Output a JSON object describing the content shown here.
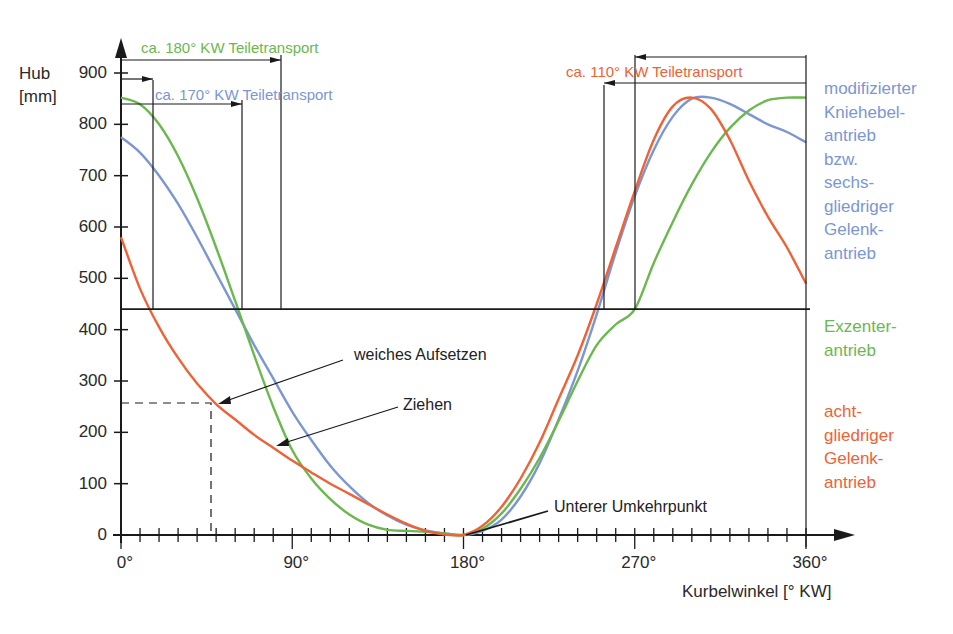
{
  "chart_data": {
    "type": "line",
    "title": "",
    "xlabel": "Kurbelwinkel [° KW]",
    "ylabel": "Hub [mm]",
    "ylabel_lines": [
      "Hub",
      "[mm]"
    ],
    "xlim": [
      0,
      360
    ],
    "ylim": [
      0,
      900
    ],
    "x_ticks": [
      0,
      90,
      180,
      270,
      360
    ],
    "x_tick_labels": [
      "0°",
      "90°",
      "180°",
      "270°",
      "360°"
    ],
    "minor_x_tick_step": 10,
    "y_ticks": [
      0,
      100,
      200,
      300,
      400,
      500,
      600,
      700,
      800,
      900
    ],
    "y_tick_labels": [
      "0",
      "100",
      "200",
      "300",
      "400",
      "500",
      "600",
      "700",
      "800",
      "900"
    ],
    "grid": false,
    "reference_line_y": 440,
    "series": [
      {
        "name": "modifizierter Kniehebelantrieb bzw. sechsgliedriger Gelenkantrieb",
        "color": "#7b96d2",
        "x": [
          0,
          10,
          20,
          30,
          40,
          50,
          60,
          70,
          80,
          90,
          100,
          110,
          120,
          130,
          140,
          150,
          160,
          170,
          180,
          190,
          200,
          210,
          220,
          230,
          240,
          250,
          260,
          270,
          280,
          290,
          300,
          310,
          320,
          330,
          340,
          350,
          360
        ],
        "y": [
          775,
          745,
          700,
          645,
          580,
          510,
          440,
          370,
          305,
          240,
          185,
          135,
          95,
          62,
          38,
          20,
          9,
          3,
          0,
          8,
          30,
          75,
          140,
          225,
          320,
          430,
          550,
          660,
          750,
          815,
          850,
          852,
          840,
          820,
          800,
          785,
          765
        ]
      },
      {
        "name": "Exzenterantrieb",
        "color": "#6ab84e",
        "x": [
          0,
          10,
          20,
          30,
          40,
          50,
          60,
          70,
          80,
          90,
          100,
          110,
          120,
          130,
          140,
          150,
          160,
          170,
          180,
          190,
          200,
          210,
          220,
          230,
          240,
          250,
          260,
          270,
          280,
          290,
          300,
          310,
          320,
          330,
          340,
          350,
          360
        ],
        "y": [
          852,
          839,
          800,
          738,
          656,
          560,
          456,
          350,
          250,
          165,
          110,
          70,
          40,
          20,
          10,
          8,
          6,
          3,
          0,
          12,
          42,
          90,
          150,
          222,
          300,
          370,
          410,
          440,
          530,
          610,
          683,
          745,
          793,
          827,
          847,
          852,
          852
        ]
      },
      {
        "name": "achtgliedriger Gelenkantrieb",
        "color": "#ee6236",
        "x": [
          0,
          10,
          20,
          30,
          40,
          50,
          60,
          70,
          80,
          90,
          100,
          110,
          120,
          130,
          140,
          150,
          160,
          170,
          180,
          190,
          200,
          210,
          220,
          230,
          240,
          250,
          260,
          270,
          280,
          290,
          300,
          310,
          320,
          330,
          340,
          350,
          360
        ],
        "y": [
          580,
          480,
          405,
          345,
          295,
          255,
          225,
          195,
          170,
          145,
          122,
          100,
          80,
          60,
          40,
          22,
          8,
          1,
          0,
          18,
          55,
          110,
          180,
          265,
          350,
          450,
          560,
          670,
          770,
          835,
          852,
          830,
          770,
          690,
          620,
          560,
          490
        ]
      }
    ],
    "annotations": [
      {
        "text": "ca. 180° KW Teiletransport",
        "color": "#6ab84e"
      },
      {
        "text": "ca. 170° KW Teiletransport",
        "color": "#7b96d2"
      },
      {
        "text": "ca. 110° KW Teiletransport",
        "color": "#ee6236"
      },
      {
        "text": "weiches Aufsetzen",
        "color": "#222222"
      },
      {
        "text": "Ziehen",
        "color": "#222222"
      },
      {
        "text": "Unterer Umkehrpunkt",
        "color": "#222222"
      }
    ],
    "legend": [
      {
        "lines": [
          "modifizierter",
          "Kniehebel-",
          "antrieb",
          "bzw.",
          "sechs-",
          "gliedriger",
          "Gelenk-",
          "antrieb"
        ],
        "color": "#7b96d2"
      },
      {
        "lines": [
          "Exzenter-",
          "antrieb"
        ],
        "color": "#6ab84e"
      },
      {
        "lines": [
          "acht-",
          "gliedriger",
          "Gelenk-",
          "antrieb"
        ],
        "color": "#ee6236"
      }
    ],
    "legend_position": "right"
  }
}
